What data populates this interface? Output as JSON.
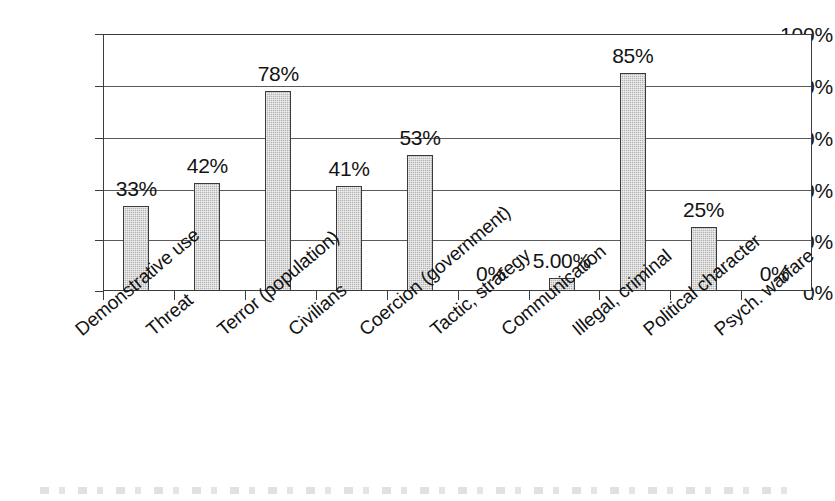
{
  "chart_data": {
    "type": "bar",
    "title": "",
    "subtitle": "",
    "xlabel": "",
    "ylabel": "",
    "ylim": [
      0,
      100
    ],
    "grid": true,
    "legend": false,
    "orientation": "vertical",
    "bar_color": "#b4b4b4",
    "bar_border_color": "#3b3b3b",
    "axis_color": "#3c3c3c",
    "categories": [
      "Demonstrative use",
      "Threat",
      "Terror (population)",
      "Civilians",
      "Coercion (government)",
      "Tactic, strategy",
      "Communication",
      "Illegal, criminal",
      "Political character",
      "Psych. warfare"
    ],
    "values": [
      33,
      42,
      78,
      41,
      53,
      0,
      5,
      85,
      25,
      0
    ],
    "data_labels": [
      "33%",
      "42%",
      "78%",
      "41%",
      "53%",
      "0%",
      "5.00%",
      "85%",
      "25%",
      "0%"
    ],
    "y_ticks": [
      0,
      20,
      40,
      60,
      80,
      100
    ],
    "y_tick_labels": [
      "0%",
      "20%",
      "40%",
      "60%",
      "80%",
      "100%"
    ]
  }
}
